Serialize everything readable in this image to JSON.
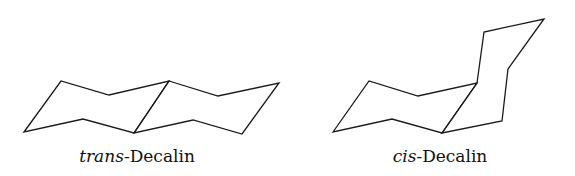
{
  "molecules": [
    {
      "name": "trans-decalin",
      "label_prefix": "trans",
      "label_suffix": "-Decalin",
      "label_center_x": 137,
      "rings": [
        [
          [
            24,
            132
          ],
          [
            61,
            81
          ],
          [
            109,
            95
          ],
          [
            169,
            81
          ],
          [
            134,
            133
          ],
          [
            83,
            119
          ]
        ],
        [
          [
            169,
            81
          ],
          [
            218,
            96
          ],
          [
            279,
            83
          ],
          [
            242,
            134
          ],
          [
            193,
            120
          ],
          [
            134,
            133
          ]
        ]
      ]
    },
    {
      "name": "cis-decalin",
      "label_prefix": "cis",
      "label_suffix": "-Decalin",
      "label_center_x": 440,
      "rings": [
        [
          [
            333,
            132
          ],
          [
            369,
            81
          ],
          [
            418,
            96
          ],
          [
            477,
            83
          ],
          [
            442,
            133
          ],
          [
            392,
            119
          ]
        ],
        [
          [
            477,
            83
          ],
          [
            484,
            32
          ],
          [
            544,
            19
          ],
          [
            508,
            69
          ],
          [
            502,
            121
          ],
          [
            442,
            133
          ]
        ]
      ]
    }
  ],
  "colors": {
    "stroke": "#1a1a1a",
    "text": "#111111",
    "background": "#ffffff"
  }
}
